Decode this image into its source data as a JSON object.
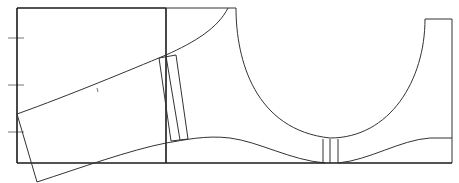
{
  "diagram": {
    "type": "sewing-pattern-draft",
    "colors": {
      "line": "#1a1a1a",
      "thin_line": "#333333",
      "tick": "#777777",
      "background": "#ffffff"
    },
    "left_ticks_count": 3,
    "elements": [
      "outer-frame",
      "center-vertical-line",
      "top-curve",
      "tilted-overlay-piece",
      "slanted-band",
      "concave-cutout-curve",
      "right-tab",
      "bottom-hem-curve",
      "center-bottom-band"
    ]
  }
}
